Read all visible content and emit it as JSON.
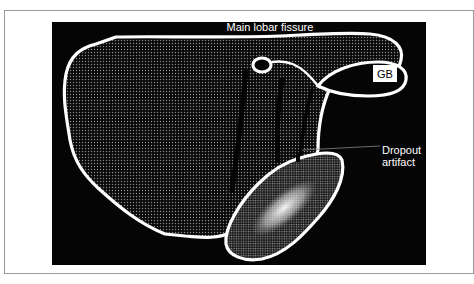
{
  "figure": {
    "type": "schematic ultrasound diagram of liver",
    "labels": {
      "fissure": "Main lobar fissure",
      "gallbladder": "GB",
      "artifact_line1": "Dropout",
      "artifact_line2": "artifact"
    },
    "colors": {
      "background": "#050505",
      "outline": "#ffffff",
      "frame": "#9a9a9a"
    }
  }
}
